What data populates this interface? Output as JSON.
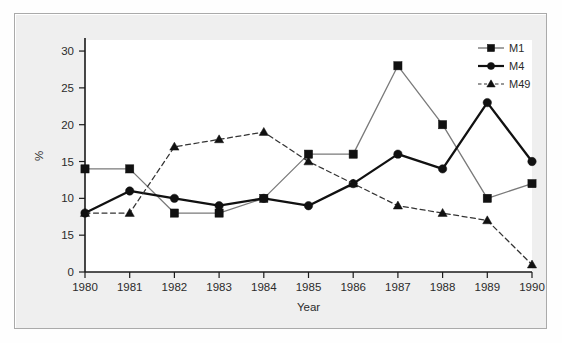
{
  "chart_data": {
    "type": "line",
    "title": "",
    "xlabel": "Year",
    "ylabel": "%",
    "categories": [
      "1980",
      "1981",
      "1982",
      "1983",
      "1984",
      "1985",
      "1986",
      "1987",
      "1988",
      "1989",
      "1990"
    ],
    "x_tick_labels": [
      "1980",
      "1981",
      "1982",
      "1983",
      "1984",
      "1985",
      "1986",
      "1987",
      "1988",
      "1989",
      "1990"
    ],
    "y_tick_labels": [
      "0",
      "15",
      "10",
      "15",
      "20",
      "25",
      "30"
    ],
    "y_tick_values": [
      0,
      5,
      10,
      15,
      20,
      25,
      30
    ],
    "ylim": [
      0,
      31.5
    ],
    "grid": false,
    "legend_position": "top-right",
    "series": [
      {
        "name": "M1",
        "marker": "square",
        "line_style": "solid",
        "color": "#7a7a7a",
        "marker_color": "#111111",
        "values": [
          14,
          14,
          8,
          8,
          10,
          16,
          16,
          28,
          20,
          10,
          12
        ]
      },
      {
        "name": "M4",
        "marker": "circle",
        "line_style": "solid",
        "color": "#111111",
        "marker_color": "#111111",
        "values": [
          8,
          11,
          10,
          9,
          10,
          9,
          12,
          16,
          14,
          23,
          15
        ]
      },
      {
        "name": "M49",
        "marker": "triangle",
        "line_style": "dashed",
        "color": "#333333",
        "marker_color": "#111111",
        "values": [
          8,
          8,
          17,
          18,
          19,
          15,
          12,
          9,
          8,
          7,
          1
        ]
      }
    ]
  },
  "legend": {
    "entries": [
      {
        "label": "M1"
      },
      {
        "label": "M4"
      },
      {
        "label": "M49"
      }
    ]
  },
  "axes": {
    "x_title": "Year",
    "y_title": "%"
  },
  "colors": {
    "frame_background": "#efefef",
    "frame_border": "#aaaaaa",
    "plot_background": "#ffffff",
    "axis": "#1a1a1a",
    "text": "#2b2b2b"
  }
}
